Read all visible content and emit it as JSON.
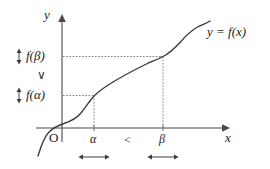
{
  "figure": {
    "type": "math-graph",
    "background_color": "#ffffff",
    "line_color": "#3a3a3a",
    "text_color": "#222222"
  },
  "axes": {
    "x_label": "x",
    "y_label": "y",
    "origin_label": "O",
    "x_axis_y_px": 128,
    "y_axis_x_px": 62,
    "x_axis_end_px": 226,
    "y_axis_top_px": 16
  },
  "curve": {
    "label": "y = f(x)",
    "shape": "monotonically increasing sigmoid-like curve",
    "points_px": [
      [
        40,
        152
      ],
      [
        46,
        140
      ],
      [
        52,
        131
      ],
      [
        58,
        126
      ],
      [
        66,
        122
      ],
      [
        74,
        118
      ],
      [
        82,
        110
      ],
      [
        88,
        103
      ],
      [
        94,
        96
      ],
      [
        104,
        88
      ],
      [
        116,
        80
      ],
      [
        128,
        73
      ],
      [
        140,
        67
      ],
      [
        152,
        62
      ],
      [
        163,
        57
      ],
      [
        173,
        50
      ],
      [
        182,
        41
      ],
      [
        190,
        33
      ],
      [
        198,
        28
      ],
      [
        206,
        25
      ],
      [
        211,
        21
      ]
    ]
  },
  "markers": {
    "alpha": {
      "x_tick_label": "α",
      "value_label": "f(α)",
      "x_px": 94,
      "y_px": 96
    },
    "beta": {
      "x_tick_label": "β",
      "value_label": "f(β)",
      "x_px": 163,
      "y_px": 57
    }
  },
  "relations": {
    "x_relation": "<",
    "y_relation": "∨",
    "x_relation_note": "alpha is less than beta",
    "y_relation_note": "f(alpha) is less than f(beta)"
  },
  "annotations": {
    "vertical_arrow": "↕",
    "horizontal_arrow": "↔",
    "alpha_range_arrow": "↔",
    "beta_range_arrow": "↔",
    "f_alpha_arrow": "↕",
    "f_beta_arrow": "↕"
  }
}
